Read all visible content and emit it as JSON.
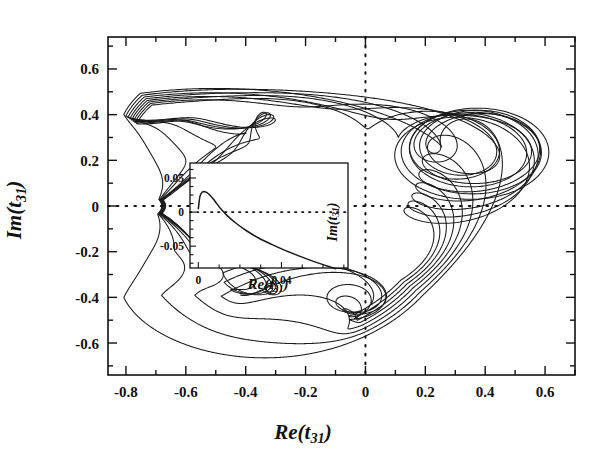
{
  "figure": {
    "kind": "argand-trajectory-plot",
    "xlabel": "Re(t31)",
    "ylabel": "Im(t31)"
  },
  "chart_data": {
    "type": "line",
    "title": "",
    "xlabel": "Re(t_31)",
    "ylabel": "Im(t_31)",
    "xlim": [
      -0.86,
      0.7
    ],
    "ylim": [
      -0.74,
      0.74
    ],
    "grid": false,
    "legend": "none",
    "xticks": [
      -0.8,
      -0.6,
      -0.4,
      -0.2,
      0,
      0.2,
      0.4,
      0.6
    ],
    "xticklabels": [
      "-0.8",
      "-0.6",
      "-0.4",
      "-0.2",
      "0",
      "0.2",
      "0.4",
      "0.6"
    ],
    "yticks": [
      -0.6,
      -0.4,
      -0.2,
      0,
      0.2,
      0.4,
      0.6
    ],
    "yticklabels": [
      "-0.6",
      "-0.4",
      "-0.2",
      "0",
      "0.2",
      "0.4",
      "0.6"
    ],
    "xminor_step": 0.1,
    "yminor_step": 0.1,
    "reference_lines": [
      {
        "orientation": "horizontal",
        "value": 0,
        "style": "dotted"
      },
      {
        "orientation": "vertical",
        "value": 0,
        "style": "dotted"
      }
    ],
    "series": [
      {
        "name": "loop-1",
        "winding": 1,
        "radius": 0.665,
        "cusp_x": -0.68,
        "spiral_center": [
          0.42,
          0.255
        ]
      },
      {
        "name": "loop-2",
        "winding": 2,
        "radius": 0.655,
        "cusp_x": -0.678,
        "spiral_center": [
          0.415,
          0.25
        ]
      },
      {
        "name": "loop-3",
        "winding": 3,
        "radius": 0.645,
        "cusp_x": -0.676,
        "spiral_center": [
          0.41,
          0.245
        ]
      },
      {
        "name": "loop-4",
        "winding": 4,
        "radius": 0.636,
        "cusp_x": -0.674,
        "spiral_center": [
          0.405,
          0.242
        ]
      },
      {
        "name": "loop-5",
        "winding": 5,
        "radius": 0.628,
        "cusp_x": -0.672,
        "spiral_center": [
          0.402,
          0.238
        ]
      },
      {
        "name": "loop-6",
        "winding": 6,
        "radius": 0.62,
        "cusp_x": -0.67,
        "spiral_center": [
          0.398,
          0.235
        ]
      },
      {
        "name": "loop-7",
        "winding": 7,
        "radius": 0.612,
        "cusp_x": -0.668,
        "spiral_center": [
          0.395,
          0.232
        ]
      },
      {
        "name": "loop-8",
        "winding": 8,
        "radius": 0.604,
        "cusp_x": -0.666,
        "spiral_center": [
          0.392,
          0.23
        ]
      }
    ]
  },
  "inset": {
    "xlabel": "Re(t31)",
    "ylabel": "Im(t31)",
    "chart_data": {
      "type": "line",
      "xlim": [
        -0.004,
        0.072
      ],
      "ylim": [
        -0.082,
        0.072
      ],
      "grid": false,
      "xticks": [
        0,
        0.04
      ],
      "xticklabels": [
        "0",
        "0.04"
      ],
      "yticks": [
        -0.05,
        0,
        0.05
      ],
      "yticklabels": [
        "-0.05",
        "0",
        "0.05"
      ],
      "xminor_step": 0.01,
      "yminor_step": 0.0125,
      "reference_lines": [
        {
          "orientation": "horizontal",
          "value": 0,
          "style": "dotted"
        }
      ],
      "description": "Low-energy start of the trajectory: the curve rises from the origin to a small positive maximum near Re=0.004, Im=0.030, then falls monotonically, crossing Im=0 near Re=0.010 and descending past Im=-0.08.",
      "points_x": [
        0.0,
        0.0008,
        0.0018,
        0.003,
        0.0042,
        0.0055,
        0.007,
        0.009,
        0.011,
        0.014,
        0.018,
        0.023,
        0.029,
        0.035,
        0.042,
        0.049,
        0.056,
        0.062,
        0.066
      ],
      "points_y": [
        0.005,
        0.023,
        0.029,
        0.03,
        0.0285,
        0.025,
        0.02,
        0.012,
        0.004,
        -0.0055,
        -0.016,
        -0.027,
        -0.038,
        -0.047,
        -0.0565,
        -0.065,
        -0.073,
        -0.079,
        -0.083
      ]
    }
  },
  "labels": {
    "x_main": "Re(t",
    "x_main_sub": "31",
    "x_main_close": ")",
    "y_main": "Im(t",
    "y_main_sub": "31",
    "y_main_close": ")",
    "x_inset": "Re(t",
    "x_inset_sub": "31",
    "x_inset_close": ")",
    "y_inset": "Im(t",
    "y_inset_sub": "31",
    "y_inset_close": ")"
  },
  "colors": {
    "ink": "#111111",
    "background": "#ffffff",
    "curve": "#1a1a1a"
  }
}
